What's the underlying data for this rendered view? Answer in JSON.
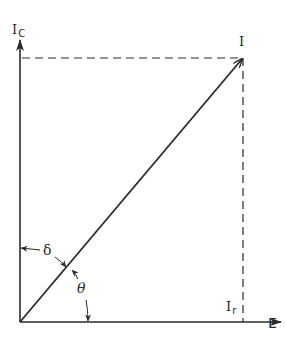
{
  "diagram": {
    "type": "phasor",
    "labels": {
      "vertical_axis": "I",
      "vertical_axis_sub": "C",
      "resultant": "I",
      "horizontal_component": "I",
      "horizontal_component_sub": "r",
      "horizontal_axis": "E",
      "angle_delta": "δ",
      "angle_theta": "θ"
    },
    "colors": {
      "line": "#2a2a2a",
      "background": "#ffffff"
    }
  }
}
